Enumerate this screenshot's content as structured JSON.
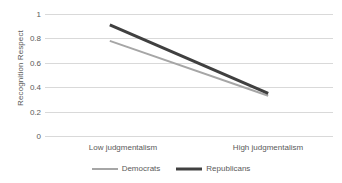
{
  "chart_data": {
    "type": "line",
    "title": "",
    "xlabel": "",
    "ylabel": "Recognition Respect",
    "categories": [
      "Low judgmentalism",
      "High judgmentalism"
    ],
    "ylim": [
      0,
      1
    ],
    "y_ticks": [
      "0",
      "0.2",
      "0.4",
      "0.6",
      "0.8",
      "1"
    ],
    "y_tick_values": [
      0,
      0.2,
      0.4,
      0.6,
      0.8,
      1
    ],
    "grid": true,
    "legend_position": "bottom",
    "series": [
      {
        "name": "Democrats",
        "values": [
          0.78,
          0.33
        ],
        "color": "#a6a6a6",
        "line_width": 2
      },
      {
        "name": "Republicans",
        "values": [
          0.91,
          0.35
        ],
        "color": "#404040",
        "line_width": 3
      }
    ]
  },
  "axis": {
    "y_title": "Recognition Respect",
    "y_ticks": [
      "1",
      "0.8",
      "0.6",
      "0.4",
      "0.2",
      "0"
    ],
    "x_ticks": [
      "Low judgmentalism",
      "High judgmentalism"
    ]
  },
  "legend": {
    "items": [
      {
        "label": "Democrats",
        "color": "#a6a6a6"
      },
      {
        "label": "Republicans",
        "color": "#404040"
      }
    ]
  },
  "colors": {
    "gridline": "#d9d9d9",
    "text": "#5a5a5a",
    "democrats": "#a6a6a6",
    "republicans": "#404040",
    "background": "#ffffff"
  }
}
